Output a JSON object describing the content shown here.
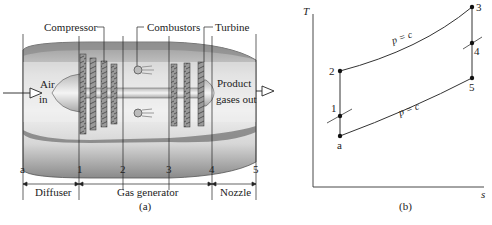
{
  "panel_a": {
    "caption": "(a)",
    "component_labels": {
      "compressor": "Compressor",
      "combustors": "Combustors",
      "turbine": "Turbine"
    },
    "inlet_label_line1": "Air",
    "inlet_label_line2": "in",
    "outlet_label_line1": "Product",
    "outlet_label_line2": "gases out",
    "stations": [
      "a",
      "1",
      "2",
      "3",
      "4",
      "5"
    ],
    "sections": {
      "diffuser": "Diffuser",
      "gas_generator": "Gas generator",
      "nozzle": "Nozzle"
    }
  },
  "panel_b": {
    "caption": "(b)",
    "y_axis_label": "T",
    "x_axis_label": "s",
    "state_points": {
      "a": "a",
      "p1": "1",
      "p2": "2",
      "p3": "3",
      "p4": "4",
      "p5": "5"
    },
    "isobar_label_high": "p = c",
    "isobar_label_low": "p = c"
  },
  "colors": {
    "ink": "#222222",
    "shell_dark": "#7a7a7a",
    "shell_light": "#d8d8d8",
    "blade": "#8c8c8c"
  }
}
